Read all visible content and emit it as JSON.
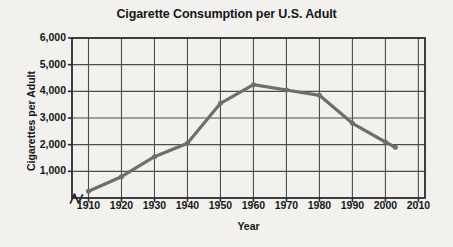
{
  "chart_data": {
    "type": "line",
    "title": "Cigarette Consumption per U.S. Adult",
    "xlabel": "Year",
    "ylabel": "Cigarettes per Adult",
    "x": [
      1910,
      1920,
      1930,
      1940,
      1950,
      1960,
      1970,
      1980,
      1990,
      2000,
      2003
    ],
    "values": [
      250,
      800,
      1550,
      2050,
      3550,
      4250,
      4050,
      3850,
      2800,
      2100,
      1900
    ],
    "series": [
      {
        "name": "Cigarettes per Adult",
        "values": [
          250,
          800,
          1550,
          2050,
          3550,
          4250,
          4050,
          3850,
          2800,
          2100,
          1900
        ]
      }
    ],
    "xticks": [
      "1910",
      "1920",
      "1930",
      "1940",
      "1950",
      "1960",
      "1970",
      "1980",
      "1990",
      "2000",
      "2010"
    ],
    "xtick_values": [
      1910,
      1920,
      1930,
      1940,
      1950,
      1960,
      1970,
      1980,
      1990,
      2000,
      2010
    ],
    "yticks": [
      "1,000",
      "2,000",
      "3,000",
      "4,000",
      "5,000",
      "6,000"
    ],
    "ytick_values": [
      1000,
      2000,
      3000,
      4000,
      5000,
      6000
    ],
    "xlim": [
      1905,
      2012
    ],
    "ylim": [
      0,
      6000
    ],
    "grid": true,
    "legend": false,
    "axis_break": true,
    "line_color": "#6e6e6e",
    "grid_color": "#4d4d4d",
    "axis_color": "#2b2b2b",
    "text_color": "#161616",
    "background_color": "#f2f1ee"
  }
}
